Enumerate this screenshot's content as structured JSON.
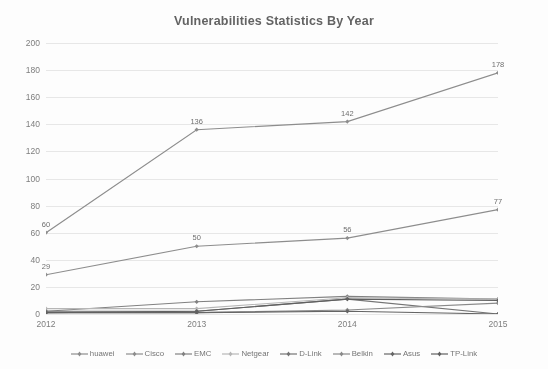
{
  "chart_data": {
    "type": "line",
    "title": "Vulnerabilities Statistics By Year",
    "xlabel": "",
    "ylabel": "",
    "categories": [
      "2012",
      "2013",
      "2014",
      "2015"
    ],
    "x": [
      2012,
      2013,
      2014,
      2015
    ],
    "ylim": [
      0,
      200
    ],
    "ytick_step": 20,
    "yticks": [
      "200",
      "180",
      "160",
      "140",
      "120",
      "100",
      "80",
      "60",
      "40",
      "20",
      "0"
    ],
    "grid": "horizontal",
    "legend_position": "bottom",
    "series": [
      {
        "name": "huawei",
        "color": "#8a8a8a",
        "values": [
          60,
          136,
          142,
          178
        ],
        "labels": [
          "60",
          "136",
          "142",
          "178"
        ],
        "show_labels": true
      },
      {
        "name": "Cisco",
        "color": "#8a8a8a",
        "values": [
          29,
          50,
          56,
          77
        ],
        "labels": [
          "29",
          "50",
          "56",
          "77"
        ],
        "show_labels": true
      },
      {
        "name": "EMC",
        "color": "#7d7d7d",
        "values": [
          2,
          9,
          13,
          11
        ],
        "labels": [
          "",
          "",
          "",
          ""
        ],
        "show_labels": false
      },
      {
        "name": "Netgear",
        "color": "#b5b5b5",
        "values": [
          4,
          4,
          12,
          11
        ],
        "labels": [
          "",
          "",
          "",
          ""
        ],
        "show_labels": false
      },
      {
        "name": "D-Link",
        "color": "#6f6f6f",
        "values": [
          2,
          2,
          11,
          0
        ],
        "labels": [
          "",
          "",
          "",
          ""
        ],
        "show_labels": false
      },
      {
        "name": "Belkin",
        "color": "#878787",
        "values": [
          1,
          1,
          3,
          8
        ],
        "labels": [
          "",
          "",
          "",
          ""
        ],
        "show_labels": false
      },
      {
        "name": "Asus",
        "color": "#5f5f5f",
        "values": [
          1,
          1,
          2,
          0
        ],
        "labels": [
          "",
          "",
          "",
          ""
        ],
        "show_labels": false
      },
      {
        "name": "TP-Link",
        "color": "#5a5a5a",
        "values": [
          1,
          2,
          11,
          10
        ],
        "labels": [
          "",
          "",
          "",
          ""
        ],
        "show_labels": false
      }
    ]
  }
}
